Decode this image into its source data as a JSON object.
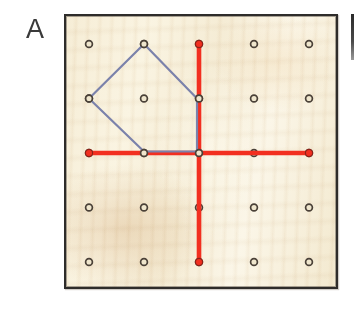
{
  "figure": {
    "panel_label": "A",
    "kind": "geoboard-illustration",
    "caption_text": ""
  },
  "board": {
    "background_color": "#f7f0da",
    "frame_color": "#2e2c2a",
    "frame_x": 64,
    "frame_y": 14,
    "frame_width": 274,
    "frame_height": 275
  },
  "grid": {
    "rows": 5,
    "cols": 5,
    "spacing_x": 55,
    "spacing_y": 54.5,
    "origin_x": 25,
    "origin_y": 30,
    "peg_color": "#4a4138",
    "peg_radius": 3.4,
    "peg_hole_color": "#efe6cd"
  },
  "red_axes": {
    "color": "#f22f20",
    "stroke_width": 4.6,
    "endpoint_radius": 3.6,
    "vertical": {
      "col": 2,
      "row_start": 0,
      "row_end": 4
    },
    "horizontal": {
      "row": 2,
      "col_start": 0,
      "col_end": 4
    }
  },
  "polygon": {
    "color": "#7b82ab",
    "stroke_width": 2.2,
    "fill": "none",
    "vertices": [
      {
        "col": 1,
        "row": 0,
        "name": "top"
      },
      {
        "col": 2,
        "row": 1,
        "name": "upper-right"
      },
      {
        "col": 2,
        "row": 2,
        "name": "lower-right"
      },
      {
        "col": 1,
        "row": 2,
        "name": "bottom"
      },
      {
        "col": 0,
        "row": 1,
        "name": "left"
      }
    ]
  },
  "next_panel": {
    "label_fragment": ""
  }
}
